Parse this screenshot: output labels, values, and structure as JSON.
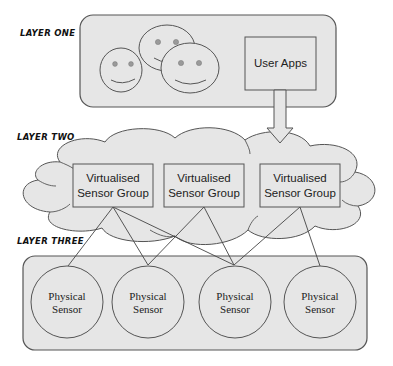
{
  "diagram": {
    "layers": [
      {
        "id": "layer-one",
        "label": "Layer One"
      },
      {
        "id": "layer-two",
        "label": "Layer Two"
      },
      {
        "id": "layer-three",
        "label": "Layer Three"
      }
    ],
    "layer_one": {
      "users_icon": "smiley-faces-users",
      "user_apps_label": "User Apps"
    },
    "layer_two": {
      "groups": [
        {
          "line1": "Virtualised",
          "line2": "Sensor Group"
        },
        {
          "line1": "Virtualised",
          "line2": "Sensor Group"
        },
        {
          "line1": "Virtualised",
          "line2": "Sensor Group"
        }
      ]
    },
    "layer_three": {
      "sensors": [
        {
          "line1": "Physical",
          "line2": "Sensor"
        },
        {
          "line1": "Physical",
          "line2": "Sensor"
        },
        {
          "line1": "Physical",
          "line2": "Sensor"
        },
        {
          "line1": "Physical",
          "line2": "Sensor"
        }
      ]
    },
    "connections": [
      {
        "from": "group-1",
        "to": "sensor-1"
      },
      {
        "from": "group-1",
        "to": "sensor-2"
      },
      {
        "from": "group-1",
        "to": "sensor-3"
      },
      {
        "from": "group-2",
        "to": "sensor-2"
      },
      {
        "from": "group-2",
        "to": "sensor-3"
      },
      {
        "from": "group-3",
        "to": "sensor-3"
      },
      {
        "from": "group-3",
        "to": "sensor-4"
      }
    ],
    "colors": {
      "panel_fill": "#e6e6e6",
      "stroke": "#555555",
      "eye_fill": "#9a9a9a"
    }
  }
}
